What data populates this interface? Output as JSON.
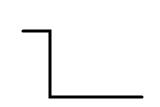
{
  "diagram": {
    "type": "step-line",
    "stroke_color": "#000000",
    "background_color": "#ffffff",
    "stroke_width": 3,
    "points": [
      [
        23,
        31
      ],
      [
        50,
        31
      ],
      [
        50,
        97
      ],
      [
        142,
        97
      ]
    ]
  }
}
